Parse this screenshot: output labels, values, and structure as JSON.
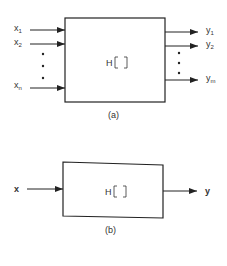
{
  "diagram_a": {
    "operator": "H",
    "caption": "(a)",
    "inputs": [
      {
        "base": "x",
        "sub": "1"
      },
      {
        "base": "x",
        "sub": "2"
      },
      {
        "base": "x",
        "sub": "n"
      }
    ],
    "outputs": [
      {
        "base": "y",
        "sub": "1"
      },
      {
        "base": "y",
        "sub": "2"
      },
      {
        "base": "y",
        "sub": "m"
      }
    ]
  },
  "diagram_b": {
    "operator": "H",
    "caption": "(b)",
    "input": "x",
    "output": "y"
  }
}
